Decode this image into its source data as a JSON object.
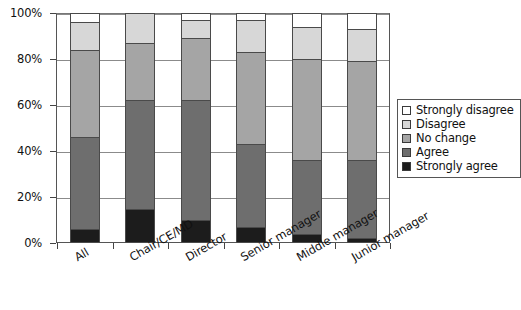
{
  "chart_data": {
    "type": "bar",
    "subtype": "stacked-bar-100-percent",
    "title": "",
    "xlabel": "",
    "ylabel": "",
    "ylim": [
      0,
      100
    ],
    "ytick_labels": [
      "0%",
      "20%",
      "40%",
      "60%",
      "80%",
      "100%"
    ],
    "ytick_values": [
      0,
      20,
      40,
      60,
      80,
      100
    ],
    "grid": "horizontal",
    "legend_position": "right-middle",
    "categories": [
      "All",
      "Chair/CE/MD",
      "Director",
      "Senior manager",
      "Middle manager",
      "Junior manager"
    ],
    "series": [
      {
        "name": "Strongly agree",
        "color": "#1c1c1c",
        "values": [
          6,
          15,
          10,
          7,
          4,
          2
        ]
      },
      {
        "name": "Agree",
        "color": "#6e6e6e",
        "values": [
          40,
          47,
          52,
          36,
          32,
          34
        ]
      },
      {
        "name": "No change",
        "color": "#a5a5a5",
        "values": [
          38,
          25,
          27,
          40,
          44,
          43
        ]
      },
      {
        "name": "Disagree",
        "color": "#d7d7d7",
        "values": [
          12,
          13,
          8,
          14,
          14,
          14
        ]
      },
      {
        "name": "Strongly disagree",
        "color": "#ffffff",
        "values": [
          4,
          0,
          3,
          3,
          6,
          7
        ]
      }
    ]
  },
  "legend": {
    "items": [
      {
        "label": "Strongly disagree",
        "color": "#ffffff"
      },
      {
        "label": "Disagree",
        "color": "#d7d7d7"
      },
      {
        "label": "No change",
        "color": "#a5a5a5"
      },
      {
        "label": "Agree",
        "color": "#6e6e6e"
      },
      {
        "label": "Strongly agree",
        "color": "#1c1c1c"
      }
    ]
  },
  "colors": {
    "axis": "#444444",
    "gridline": "#8b8b8b",
    "plot_border": "#555555",
    "text": "#111111",
    "background": "#ffffff"
  }
}
